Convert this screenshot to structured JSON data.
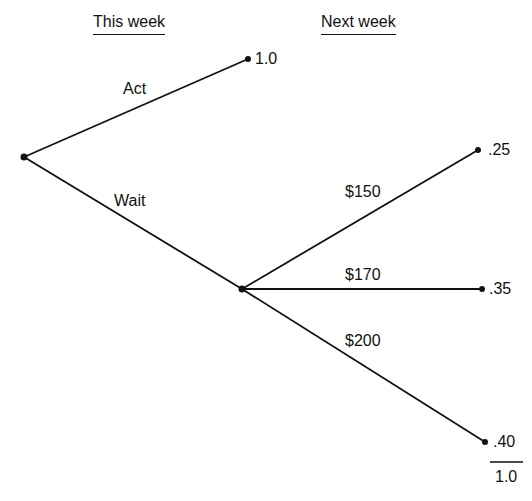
{
  "headers": {
    "this_week": "This week",
    "next_week": "Next week"
  },
  "tree": {
    "root": {
      "x": 24,
      "y": 157
    },
    "chance_node": {
      "x": 242,
      "y": 289
    },
    "branches": {
      "act": {
        "label": "Act",
        "value": "1.0",
        "end": {
          "x": 248,
          "y": 59
        }
      },
      "wait": {
        "label": "Wait"
      },
      "price_150": {
        "label": "$150",
        "probability": ".25",
        "end": {
          "x": 478,
          "y": 150
        }
      },
      "price_170": {
        "label": "$170",
        "probability": ".35",
        "end": {
          "x": 482,
          "y": 289
        }
      },
      "price_200": {
        "label": "$200",
        "probability": ".40",
        "end": {
          "x": 485,
          "y": 442
        }
      }
    },
    "total": "1.0"
  },
  "colors": {
    "line": "#111111",
    "background": "#ffffff"
  }
}
